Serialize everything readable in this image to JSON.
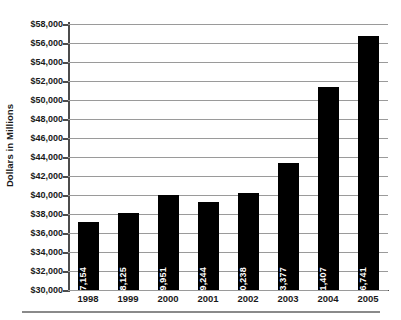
{
  "chart_data": {
    "type": "bar",
    "title": "",
    "xlabel": "",
    "ylabel": "Dollars in Millions",
    "categories": [
      "1998",
      "1999",
      "2000",
      "2001",
      "2002",
      "2003",
      "2004",
      "2005"
    ],
    "values": [
      37154,
      38125,
      39951,
      39244,
      40238,
      43377,
      51407,
      56741
    ],
    "value_labels": [
      "$37,154",
      "$38,125",
      "$39,951",
      "$39,244",
      "$40,238",
      "$43,377",
      "$51,407",
      "$56,741"
    ],
    "ylim": [
      30000,
      58000
    ],
    "ytick_step": 2000,
    "ytick_labels": [
      "$58,000",
      "$56,000",
      "$54,000",
      "$52,000",
      "$50,000",
      "$48,000",
      "$46,000",
      "$44,000",
      "$42,000",
      "$40,000",
      "$38,000",
      "$36,000",
      "$34,000",
      "$32,000",
      "$30,000"
    ],
    "ytick_values": [
      58000,
      56000,
      54000,
      52000,
      50000,
      48000,
      46000,
      44000,
      42000,
      40000,
      38000,
      36000,
      34000,
      32000,
      30000
    ],
    "grid": true,
    "grid_axis": "y",
    "legend": false,
    "bar_color": "#000000",
    "grid_color": "#9a9a9a",
    "axis_color": "#4c4c4c",
    "value_label_color": "#ffffff",
    "value_label_rotation": -90,
    "background_color": "#ffffff"
  }
}
